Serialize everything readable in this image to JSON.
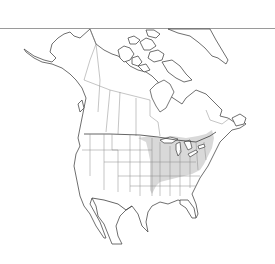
{
  "map": {
    "region": "North America",
    "type": "species range map",
    "colors": {
      "background": "#ffffff",
      "land": "#ffffff",
      "outline": "#4a4a4a",
      "internal_borders": "#8a8a8a",
      "range_fill": "#d9d9d9",
      "top_rule": "#9a9a9a"
    },
    "highlighted_area": "Eastern United States and southern Ontario/Quebec (Great Lakes and Ohio Valley to Atlantic coast)"
  }
}
